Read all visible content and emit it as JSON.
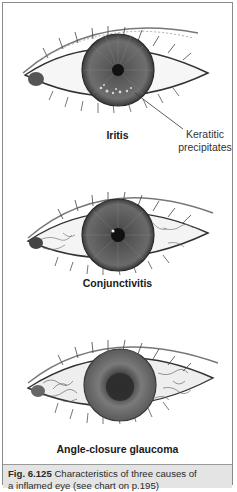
{
  "figure": {
    "panels": [
      {
        "id": "iritis",
        "label": "Iritis",
        "annotation": {
          "line1": "Keratitic",
          "line2": "precipitates"
        }
      },
      {
        "id": "conjunctivitis",
        "label": "Conjunctivitis"
      },
      {
        "id": "angle-closure-glaucoma",
        "label": "Angle-closure glaucoma"
      }
    ],
    "caption": {
      "number": "Fig. 6.125",
      "text_line1": " Characteristics of three causes of",
      "text_line2": "a inflamed eye (see chart on p.195)"
    }
  },
  "colors": {
    "frame_border": "#8a8a8a",
    "caption_bg": "#e4e4e4",
    "iris": "#6a6a6a",
    "pupil": "#111111",
    "sketch_line": "#444444"
  }
}
